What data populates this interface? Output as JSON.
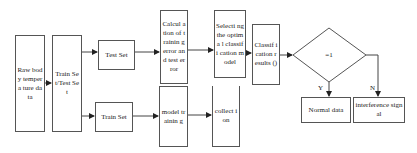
{
  "diagram": {
    "type": "flowchart",
    "nodes": {
      "raw": {
        "label": "Raw body tempera ture data"
      },
      "split": {
        "label": "Train Set/Test Set"
      },
      "test": {
        "label": "Test Set"
      },
      "train": {
        "label": "Train Set"
      },
      "calc": {
        "label": "Calcul ation of trainin g error and test error"
      },
      "select": {
        "label": "Selecti ng the optima l classifi cation model"
      },
      "classify": {
        "label": "Classif ication results ()"
      },
      "decision": {
        "label": "=1"
      },
      "model_training": {
        "label": "model trainin g"
      },
      "collection": {
        "label": "collect ion"
      },
      "normal": {
        "label": "Normal data"
      },
      "interference": {
        "label": "interference signal"
      }
    },
    "edge_labels": {
      "yes": "Y",
      "no": "N"
    },
    "edges": [
      [
        "raw",
        "split"
      ],
      [
        "split",
        "test"
      ],
      [
        "split",
        "train"
      ],
      [
        "test",
        "calc"
      ],
      [
        "calc",
        "select"
      ],
      [
        "select",
        "classify"
      ],
      [
        "classify",
        "decision"
      ],
      [
        "decision",
        "normal",
        "Y"
      ],
      [
        "decision",
        "interference",
        "N"
      ],
      [
        "train",
        "model_training"
      ],
      [
        "model_training",
        "collection"
      ]
    ]
  }
}
